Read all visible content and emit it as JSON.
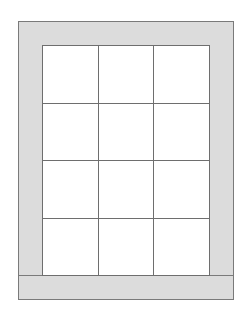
{
  "diagram": {
    "type": "quilt-layout",
    "frame": {
      "x": 18,
      "y": 21,
      "width": 216,
      "height": 279
    },
    "border_color": "#dcdcdc",
    "line_color": "#6e6e6e",
    "bands": {
      "top": {
        "x": 18,
        "y": 21,
        "width": 216,
        "height": 25
      },
      "bottom": {
        "x": 18,
        "y": 275,
        "width": 216,
        "height": 25
      },
      "left": {
        "x": 18,
        "y": 45,
        "width": 25,
        "height": 231
      },
      "right": {
        "x": 209,
        "y": 45,
        "width": 25,
        "height": 231
      }
    },
    "grid": {
      "x": 42,
      "y": 45,
      "width": 168,
      "height": 231,
      "rows": 4,
      "cols": 3
    }
  }
}
